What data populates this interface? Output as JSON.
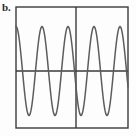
{
  "figure": {
    "panel_label": "b.",
    "label_position": "top-left"
  },
  "colors": {
    "frame": "#3a3a3a",
    "axis": "#3a3a3a",
    "curve": "#5d5d5d",
    "background": "#fdfdfd"
  },
  "plot_box": {
    "left": 16,
    "top": 7,
    "right": 128,
    "bottom": 128,
    "border_width": 1.4
  },
  "axes": {
    "horizontal_axis_y": 71,
    "vertical_axis_x": 76,
    "axis_width": 1.4
  },
  "chart_data": {
    "type": "line",
    "title": "b.",
    "subtitle": "",
    "xlabel": "",
    "ylabel": "",
    "grid": false,
    "legend": null,
    "legend_position": "none",
    "xlim": [
      0,
      4.31
    ],
    "ylim": [
      -1.05,
      1.05
    ],
    "waveform": {
      "form": "sine",
      "amplitude": 1.0,
      "period_px": 26,
      "cycles_visible": 4.31,
      "phase_at_left_edge_deg": 90,
      "peak_y_px": 28,
      "trough_y_px": 117,
      "midline_y_px": 71,
      "stroke_width": 1.5
    },
    "peaks_x_px": [
      16,
      42,
      68,
      94,
      120
    ],
    "troughs_x_px": [
      29,
      55,
      81,
      107
    ],
    "zero_crossings_x_px": [
      22.5,
      35.5,
      48.5,
      61.5,
      74.5,
      87.5,
      100.5,
      113.5,
      126.5
    ],
    "series": [
      {
        "name": "oscillation",
        "x": [
          0.0,
          0.12,
          0.25,
          0.38,
          0.5,
          0.62,
          0.75,
          0.88,
          1.0,
          1.12,
          1.25,
          1.38,
          1.5,
          1.62,
          1.75,
          1.88,
          2.0,
          2.12,
          2.25,
          2.38,
          2.5,
          2.62,
          2.75,
          2.88,
          3.0,
          3.12,
          3.25,
          3.38,
          3.5,
          3.62,
          3.75,
          3.88,
          4.0,
          4.12,
          4.25,
          4.31
        ],
        "values": [
          1.0,
          0.71,
          0.0,
          -0.71,
          -1.0,
          -0.71,
          0.0,
          0.71,
          1.0,
          0.71,
          0.0,
          -0.71,
          -1.0,
          -0.71,
          0.0,
          0.71,
          1.0,
          0.71,
          0.0,
          -0.71,
          -1.0,
          -0.71,
          0.0,
          0.71,
          1.0,
          0.71,
          0.0,
          -0.71,
          -1.0,
          -0.71,
          0.0,
          0.71,
          1.0,
          0.71,
          0.0,
          -0.42
        ]
      }
    ],
    "xticks": [],
    "xticklabels": [],
    "yticks": [],
    "yticklabels": []
  }
}
